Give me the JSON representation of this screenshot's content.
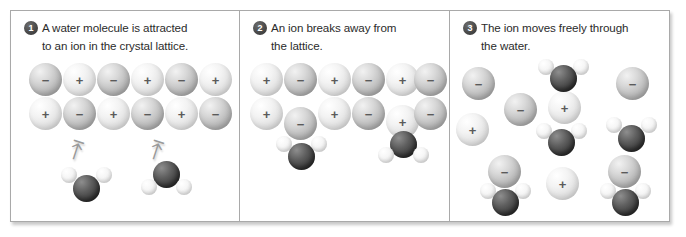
{
  "figure": {
    "panels": [
      {
        "number": "1",
        "caption_line1": "A water molecule is attracted",
        "caption_line2": "to an ion in the crystal lattice.",
        "lattice": {
          "row1": [
            "−",
            "+",
            "−",
            "+",
            "−",
            "+"
          ],
          "row2": [
            "+",
            "−",
            "+",
            "−",
            "+",
            "−"
          ]
        },
        "arrows": [
          "arrow-up-left",
          "arrow-up-right"
        ],
        "water_molecules": 2
      },
      {
        "number": "2",
        "caption_line1": "An ion breaks away from",
        "caption_line2": "the lattice.",
        "lattice": {
          "row1": [
            "+",
            "−",
            "+",
            "−",
            "+",
            "−"
          ],
          "row2": [
            "+",
            "−",
            "+",
            "−",
            "+",
            "−"
          ]
        },
        "detached_ions": [
          "−",
          "+"
        ],
        "water_molecules": 2
      },
      {
        "number": "3",
        "caption_line1": "The ion moves freely through",
        "caption_line2": "the water.",
        "free_ions": [
          "−",
          "+",
          "−",
          "+",
          "−",
          "+",
          "−",
          "−"
        ],
        "water_molecules": 5
      }
    ]
  },
  "legend": {
    "negative_sign": "−",
    "positive_sign": "+"
  },
  "colors": {
    "frame_border": "#a9a9a9",
    "background": "#ffffff",
    "text": "#2b2b2b",
    "badge_fill": "#3a3a3a",
    "badge_text": "#ffffff",
    "negative_ion": "#c4c4c4",
    "positive_ion": "#ececec",
    "oxygen": "#3a3a3a",
    "hydrogen": "#f0f0f0",
    "arrow": "#9a9a9a"
  }
}
